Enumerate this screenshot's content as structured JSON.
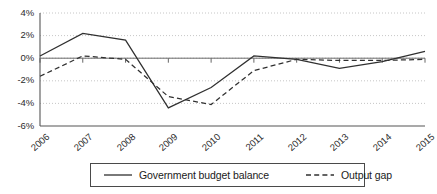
{
  "chart_data": {
    "type": "line",
    "title": "",
    "xlabel": "",
    "ylabel": "",
    "grid": true,
    "legend_position": "bottom",
    "categories": [
      "2006",
      "2007",
      "2008",
      "2009",
      "2010",
      "2011",
      "2012",
      "2013",
      "2014",
      "2015"
    ],
    "ylim": [
      -6,
      4
    ],
    "yticks": [
      4,
      2,
      0,
      -2,
      -4,
      -6
    ],
    "ytick_labels": [
      "4%",
      "2%",
      "0%",
      "-2%",
      "-4%",
      "-6%"
    ],
    "series": [
      {
        "name": "Government budget balance",
        "style": "solid",
        "color": "#303030",
        "values": [
          0.2,
          2.2,
          1.6,
          -4.4,
          -2.6,
          0.2,
          -0.1,
          -0.9,
          -0.3,
          0.6
        ]
      },
      {
        "name": "Output gap",
        "style": "dashed",
        "color": "#303030",
        "values": [
          -1.6,
          0.2,
          -0.1,
          -3.4,
          -4.1,
          -1.1,
          -0.1,
          -0.2,
          -0.2,
          -0.1
        ]
      }
    ]
  },
  "legend": {
    "items": [
      {
        "label": "Government budget balance",
        "style": "solid"
      },
      {
        "label": "Output gap",
        "style": "dashed"
      }
    ]
  },
  "axes": {
    "y_labels": [
      "4%",
      "2%",
      "0%",
      "-2%",
      "-4%",
      "-6%"
    ],
    "x_labels": [
      "2006",
      "2007",
      "2008",
      "2009",
      "2010",
      "2011",
      "2012",
      "2013",
      "2014",
      "2015"
    ]
  },
  "colors": {
    "line": "#303030",
    "grid": "#b8b8b8",
    "axis": "#555555",
    "zero_line": "#6a6a6a",
    "background": "#ffffff"
  }
}
